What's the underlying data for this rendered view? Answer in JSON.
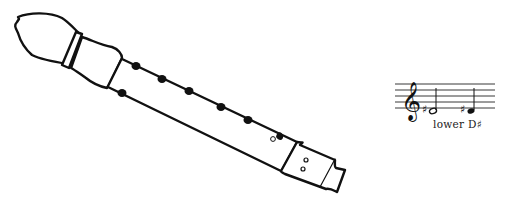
{
  "diagram": {
    "instrument": "recorder",
    "fingering": {
      "front_holes_closed": 7,
      "thumb_hole": "closed",
      "bottom_hole": "half-covered"
    },
    "notation": {
      "clef": "treble",
      "notes": [
        "D#4 (half note)",
        "D#4 (quarter note)"
      ],
      "accidental": "sharp",
      "label": "lower D♯"
    },
    "colors": {
      "ink": "#111111",
      "background": "#ffffff"
    }
  }
}
